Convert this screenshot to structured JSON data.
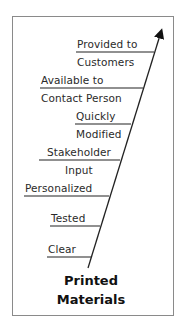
{
  "diagram": {
    "type": "herringbone-arrow",
    "title": [
      "Printed",
      "Materials"
    ],
    "branches": [
      {
        "above": "Provided to",
        "below": "Customers"
      },
      {
        "above": "Available to",
        "below": "Contact Person"
      },
      {
        "above": "Quickly",
        "below": "Modified"
      },
      {
        "above": "Stakeholder",
        "below": "Input"
      },
      {
        "above": "Personalized",
        "below": ""
      },
      {
        "above": "Tested",
        "below": ""
      },
      {
        "above": "Clear",
        "below": ""
      }
    ],
    "colors": {
      "line": "#222222",
      "frame": "#8a8a8a",
      "text": "#2a2a2a"
    }
  }
}
